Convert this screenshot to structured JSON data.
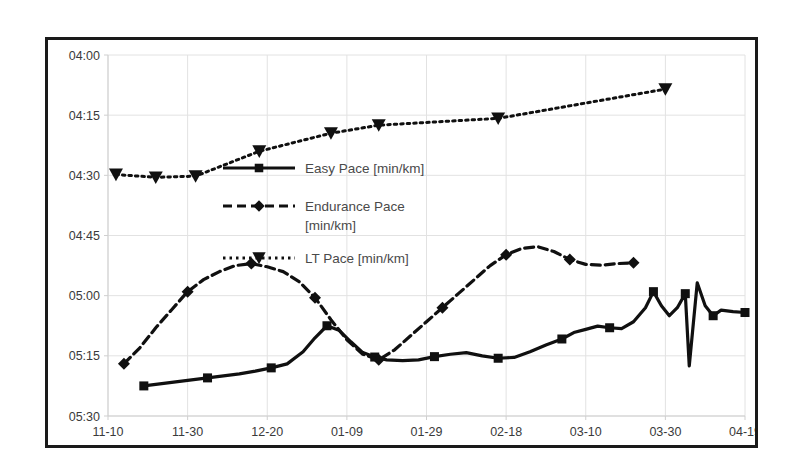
{
  "chart_data": {
    "type": "line",
    "title": "",
    "xlabel": "",
    "ylabel": "",
    "grid": true,
    "legend_position": "inside-upper-left",
    "y_axis": {
      "tick_labels": [
        "04:00",
        "04:15",
        "04:30",
        "04:45",
        "05:00",
        "05:15",
        "05:30"
      ],
      "tick_values": [
        240,
        255,
        270,
        285,
        300,
        315,
        330
      ],
      "unit": "min:sec per km",
      "inverted": true,
      "ylim": [
        240,
        330
      ]
    },
    "x_axis": {
      "tick_labels": [
        "11-10",
        "11-30",
        "12-20",
        "01-09",
        "01-29",
        "02-18",
        "03-10",
        "03-30",
        "04-19"
      ],
      "tick_values": [
        0,
        20,
        40,
        60,
        80,
        100,
        120,
        140,
        160
      ],
      "unit": "date (MM-DD)",
      "xlim": [
        0,
        160
      ]
    },
    "series": [
      {
        "name": "Easy Pace [min/km]",
        "marker": "square",
        "dash": "solid",
        "color": "#101010",
        "points": [
          [
            9,
            322.5
          ],
          [
            13,
            322.0
          ],
          [
            17,
            321.5
          ],
          [
            21,
            321.0
          ],
          [
            25,
            320.5
          ],
          [
            29,
            320.0
          ],
          [
            33,
            319.5
          ],
          [
            37,
            318.8
          ],
          [
            41,
            318.0
          ],
          [
            45,
            317.0
          ],
          [
            49,
            314.0
          ],
          [
            52,
            310.5
          ],
          [
            55,
            307.5
          ],
          [
            58,
            308.6
          ],
          [
            61,
            311.5
          ],
          [
            64,
            314.2
          ],
          [
            67,
            315.3
          ],
          [
            70,
            316.0
          ],
          [
            74,
            316.2
          ],
          [
            78,
            316.0
          ],
          [
            82,
            315.2
          ],
          [
            86,
            314.6
          ],
          [
            90,
            314.2
          ],
          [
            94,
            315.0
          ],
          [
            98,
            315.6
          ],
          [
            102,
            315.4
          ],
          [
            106,
            314.0
          ],
          [
            110,
            312.3
          ],
          [
            114,
            310.8
          ],
          [
            117,
            309.2
          ],
          [
            120,
            308.4
          ],
          [
            123,
            307.6
          ],
          [
            126,
            308.0
          ],
          [
            129,
            308.2
          ],
          [
            132,
            306.5
          ],
          [
            135,
            303.0
          ],
          [
            137,
            299.0
          ],
          [
            139,
            302.5
          ],
          [
            141,
            305.0
          ],
          [
            143,
            303.0
          ],
          [
            145,
            299.5
          ],
          [
            146,
            317.5
          ],
          [
            148,
            296.8
          ],
          [
            150,
            302.5
          ],
          [
            152,
            305.0
          ],
          [
            154,
            303.6
          ],
          [
            157,
            304.0
          ],
          [
            160,
            304.2
          ]
        ]
      },
      {
        "name": "Endurance Pace [min/km]",
        "marker": "diamond",
        "dash": "dashed",
        "color": "#101010",
        "points": [
          [
            4,
            317.0
          ],
          [
            8,
            313.0
          ],
          [
            12,
            308.0
          ],
          [
            16,
            303.5
          ],
          [
            20,
            299.0
          ],
          [
            24,
            296.0
          ],
          [
            28,
            294.0
          ],
          [
            32,
            292.5
          ],
          [
            36,
            292.0
          ],
          [
            40,
            292.8
          ],
          [
            44,
            294.0
          ],
          [
            48,
            296.5
          ],
          [
            52,
            300.5
          ],
          [
            56,
            306.0
          ],
          [
            60,
            311.0
          ],
          [
            64,
            314.6
          ],
          [
            68,
            316.0
          ],
          [
            72,
            313.5
          ],
          [
            76,
            310.0
          ],
          [
            80,
            306.5
          ],
          [
            84,
            303.0
          ],
          [
            88,
            299.5
          ],
          [
            92,
            296.0
          ],
          [
            96,
            292.5
          ],
          [
            100,
            289.8
          ],
          [
            104,
            288.2
          ],
          [
            108,
            287.8
          ],
          [
            112,
            289.0
          ],
          [
            116,
            291.0
          ],
          [
            120,
            292.2
          ],
          [
            124,
            292.4
          ],
          [
            128,
            292.0
          ],
          [
            132,
            291.8
          ]
        ]
      },
      {
        "name": "LT Pace [min/km]",
        "marker": "triangle-down",
        "dash": "dotted",
        "color": "#101010",
        "points": [
          [
            2,
            269.8
          ],
          [
            12,
            270.5
          ],
          [
            22,
            270.2
          ],
          [
            38,
            264.0
          ],
          [
            56,
            259.5
          ],
          [
            68,
            257.5
          ],
          [
            98,
            255.8
          ],
          [
            140,
            248.5
          ]
        ]
      }
    ]
  },
  "legend": {
    "items": [
      {
        "label": "Easy Pace [min/km]",
        "marker": "square",
        "dash": "solid"
      },
      {
        "label": "Endurance Pace",
        "label2": "[min/km]",
        "marker": "diamond",
        "dash": "dashed"
      },
      {
        "label": "LT Pace [min/km]",
        "marker": "triangle-down",
        "dash": "dotted"
      }
    ]
  }
}
